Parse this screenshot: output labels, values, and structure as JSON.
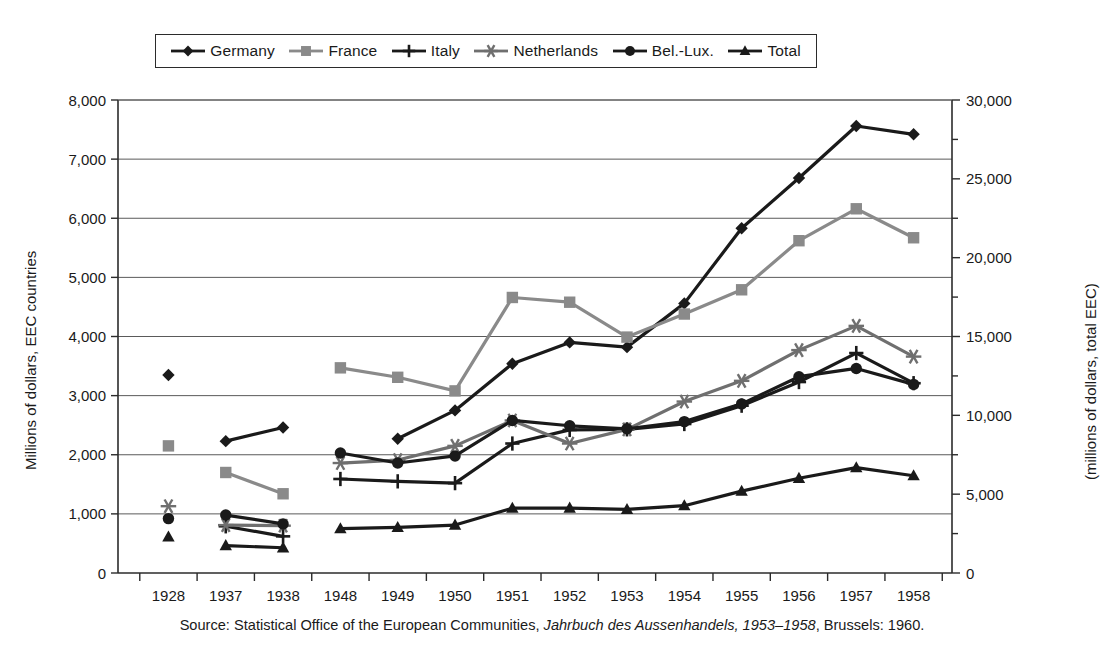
{
  "legend": {
    "items": [
      {
        "label": "Germany",
        "marker": "diamond",
        "color": "#1a1a1a"
      },
      {
        "label": "France",
        "marker": "square",
        "color": "#8a8a8a"
      },
      {
        "label": "Italy",
        "marker": "plus",
        "color": "#1a1a1a"
      },
      {
        "label": "Netherlands",
        "marker": "asterisk",
        "color": "#6f6f6f"
      },
      {
        "label": "Bel.-Lux.",
        "marker": "circle",
        "color": "#1a1a1a"
      },
      {
        "label": "Total",
        "marker": "triangle",
        "color": "#1a1a1a"
      }
    ]
  },
  "axes": {
    "y_left_title": "Millions of dollars, EEC countries",
    "y_right_title": "(millions of dollars, total EEC)",
    "y_left_ticks": [
      "0",
      "1,000",
      "2,000",
      "3,000",
      "4,000",
      "5,000",
      "6,000",
      "7,000",
      "8,000"
    ],
    "y_left_min": 0,
    "y_left_max": 8000,
    "y_right_ticks": [
      "0",
      "5,000",
      "10,000",
      "15,000",
      "20,000",
      "25,000",
      "30,000"
    ],
    "y_right_min": 0,
    "y_right_max": 30000,
    "x_labels": [
      "1928",
      "1937",
      "1938",
      "1948",
      "1949",
      "1950",
      "1951",
      "1952",
      "1953",
      "1954",
      "1955",
      "1956",
      "1957",
      "1958"
    ],
    "grid": true
  },
  "source": {
    "prefix": "Source: Statistical Office of the European Communities, ",
    "italic": "Jahrbuch des Aussenhandels, 1953–1958",
    "suffix": ", Brussels: 1960."
  },
  "chart_data": {
    "type": "line",
    "title": "",
    "xlabel": "",
    "ylabel": "Millions of dollars, EEC countries",
    "ylabel_right": "(millions of dollars, total EEC)",
    "ylim": [
      0,
      8000
    ],
    "ylim_right": [
      0,
      30000
    ],
    "grid": true,
    "legend_position": "top",
    "categories": [
      "1928",
      "1937",
      "1938",
      "1948",
      "1949",
      "1950",
      "1951",
      "1952",
      "1953",
      "1954",
      "1955",
      "1956",
      "1957",
      "1958"
    ],
    "series": [
      {
        "name": "Germany",
        "axis": "left",
        "marker": "diamond",
        "color": "#1a1a1a",
        "values": [
          3350,
          2230,
          2460,
          null,
          2270,
          2750,
          3540,
          3900,
          3820,
          4560,
          5830,
          6680,
          7560,
          7420
        ]
      },
      {
        "name": "France",
        "axis": "left",
        "marker": "square",
        "color": "#8a8a8a",
        "values": [
          2150,
          1700,
          1340,
          3470,
          3310,
          3080,
          4660,
          4580,
          3990,
          4380,
          4790,
          5620,
          6160,
          5670
        ]
      },
      {
        "name": "Italy",
        "axis": "left",
        "marker": "plus",
        "color": "#1a1a1a",
        "values": [
          null,
          790,
          620,
          1590,
          1550,
          1520,
          2190,
          2420,
          2430,
          2520,
          2830,
          3230,
          3720,
          3210
        ]
      },
      {
        "name": "Netherlands",
        "axis": "left",
        "marker": "asterisk",
        "color": "#6f6f6f",
        "values": [
          1130,
          810,
          800,
          1860,
          1910,
          2150,
          2580,
          2190,
          2430,
          2900,
          3250,
          3770,
          4180,
          3660
        ]
      },
      {
        "name": "Bel.-Lux.",
        "axis": "left",
        "marker": "circle",
        "color": "#1a1a1a",
        "values": [
          920,
          980,
          830,
          2030,
          1860,
          1980,
          2580,
          2490,
          2440,
          2560,
          2860,
          3320,
          3460,
          3190
        ]
      },
      {
        "name": "Total",
        "axis": "right",
        "marker": "triangle",
        "color": "#1a1a1a",
        "values": [
          2290,
          1740,
          1600,
          2810,
          2890,
          3040,
          4110,
          4120,
          4030,
          4270,
          5190,
          6010,
          6680,
          6170
        ]
      }
    ]
  }
}
